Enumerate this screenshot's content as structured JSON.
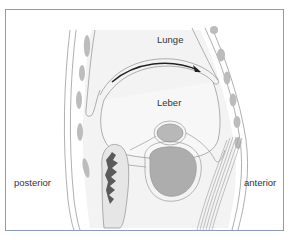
{
  "figure": {
    "labels": {
      "lung": "Lunge",
      "liver": "Leber",
      "posterior": "posterior",
      "anterior": "anterior"
    },
    "colors": {
      "frame": "#8b9cb8",
      "outline": "#9a9a9a",
      "tissue_fill": "#f0f0f0",
      "rib_fill": "#bcbcbc",
      "organ_fill": "#b0b0b0",
      "dark_organ": "#5a5a5a",
      "arrow": "#222222"
    }
  }
}
